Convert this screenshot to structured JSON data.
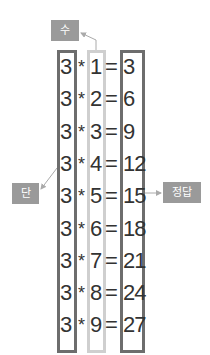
{
  "labels": {
    "su": "수",
    "dan": "단",
    "answer": "정답"
  },
  "rows": [
    {
      "dan": "3",
      "op": "*",
      "su": "1",
      "eq": "=",
      "answer": "3"
    },
    {
      "dan": "3",
      "op": "*",
      "su": "2",
      "eq": "=",
      "answer": "6"
    },
    {
      "dan": "3",
      "op": "*",
      "su": "3",
      "eq": "=",
      "answer": "9"
    },
    {
      "dan": "3",
      "op": "*",
      "su": "4",
      "eq": "=",
      "answer": "12"
    },
    {
      "dan": "3",
      "op": "*",
      "su": "5",
      "eq": "=",
      "answer": "15"
    },
    {
      "dan": "3",
      "op": "*",
      "su": "6",
      "eq": "=",
      "answer": "18"
    },
    {
      "dan": "3",
      "op": "*",
      "su": "7",
      "eq": "=",
      "answer": "21"
    },
    {
      "dan": "3",
      "op": "*",
      "su": "8",
      "eq": "=",
      "answer": "24"
    },
    {
      "dan": "3",
      "op": "*",
      "su": "9",
      "eq": "=",
      "answer": "27"
    }
  ],
  "colors": {
    "tag_bg": "#9a9a9a",
    "dark_border": "#6d6d6d",
    "light_border": "#cfcfcf",
    "text": "#333333",
    "arrow": "#aaaaaa"
  }
}
